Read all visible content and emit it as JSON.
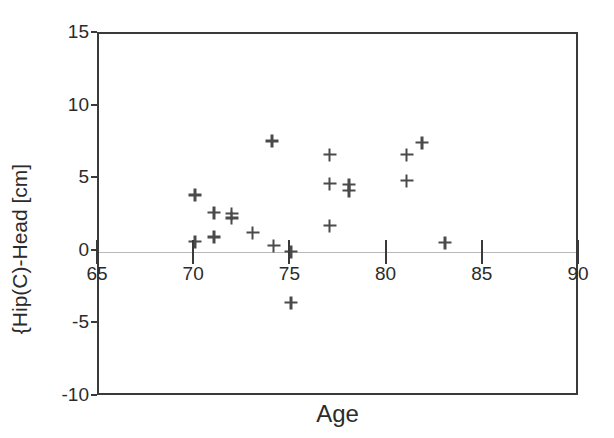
{
  "chart_data": {
    "type": "scatter",
    "title": "",
    "xlabel": "Age",
    "ylabel": "{Hip(C)-Head [cm]",
    "xlim": [
      65,
      90
    ],
    "ylim": [
      -10,
      15
    ],
    "xticks": [
      65,
      70,
      75,
      80,
      85,
      90
    ],
    "yticks": [
      -10,
      -5,
      0,
      5,
      10,
      15
    ],
    "xticklabels": [
      "65",
      "70",
      "75",
      "80",
      "85",
      "90"
    ],
    "yticklabels": [
      "-10",
      "-5",
      "0",
      "5",
      "10",
      "15"
    ],
    "grid": false,
    "legend": null,
    "marker": "plus",
    "marker_color": "#4a4a4a",
    "zero_reference_line": 0,
    "points": [
      {
        "x": 70.0,
        "y": 3.9
      },
      {
        "x": 70.0,
        "y": 0.7
      },
      {
        "x": 71.0,
        "y": 2.7
      },
      {
        "x": 71.0,
        "y": 1.0
      },
      {
        "x": 71.9,
        "y": 2.6
      },
      {
        "x": 71.9,
        "y": 2.3
      },
      {
        "x": 73.0,
        "y": 1.3
      },
      {
        "x": 74.0,
        "y": 7.6
      },
      {
        "x": 74.1,
        "y": 0.4
      },
      {
        "x": 75.0,
        "y": 0.0
      },
      {
        "x": 75.0,
        "y": -3.5
      },
      {
        "x": 77.0,
        "y": 6.7
      },
      {
        "x": 77.0,
        "y": 4.7
      },
      {
        "x": 77.0,
        "y": 1.8
      },
      {
        "x": 78.0,
        "y": 4.6
      },
      {
        "x": 78.0,
        "y": 4.2
      },
      {
        "x": 81.0,
        "y": 6.7
      },
      {
        "x": 81.0,
        "y": 4.9
      },
      {
        "x": 81.8,
        "y": 7.5
      },
      {
        "x": 83.0,
        "y": 0.6
      }
    ]
  }
}
